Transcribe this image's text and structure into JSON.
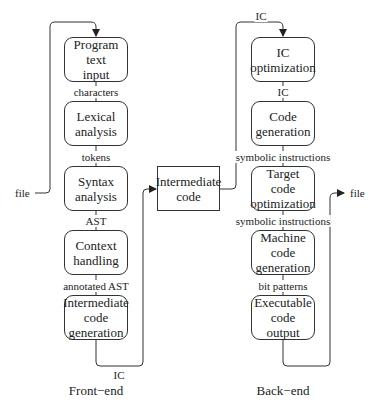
{
  "diagram": {
    "front_end": {
      "caption": "Front−end",
      "boxes": [
        {
          "label": "Program\ntext\ninput"
        },
        {
          "label": "Lexical\nanalysis"
        },
        {
          "label": "Syntax\nanalysis"
        },
        {
          "label": "Context\nhandling"
        },
        {
          "label": "Intermediate\ncode\ngeneration"
        }
      ],
      "edges": [
        "characters",
        "tokens",
        "AST",
        "annotated AST"
      ],
      "input_label": "file",
      "output_label": "IC"
    },
    "middle": {
      "label": "Intermediate\ncode"
    },
    "back_end": {
      "caption": "Back−end",
      "boxes": [
        {
          "label": "IC\noptimization"
        },
        {
          "label": "Code\ngeneration"
        },
        {
          "label": "Target\ncode\noptimization"
        },
        {
          "label": "Machine\ncode\ngeneration"
        },
        {
          "label": "Executable\ncode\noutput"
        }
      ],
      "edges": [
        "IC",
        "symbolic instructions",
        "symbolic instructions",
        "bit patterns"
      ],
      "input_label": "IC",
      "output_label": "file"
    }
  }
}
